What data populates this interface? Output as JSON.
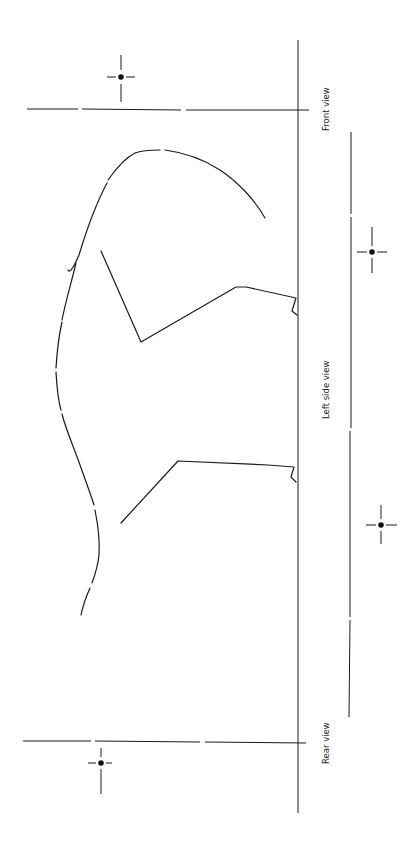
{
  "diagram": {
    "type": "orthographic-projection",
    "orientation": "rotated -90 degrees",
    "labels": {
      "front": "Front view",
      "side": "Left side view",
      "rear": "Rear view"
    },
    "colors": {
      "line": "#1a1a1a",
      "background": "#ffffff"
    },
    "elements": {
      "baselines": [
        {
          "name": "main-ground-line",
          "orientation": "vertical"
        },
        {
          "name": "secondary-reference-line",
          "orientation": "vertical"
        },
        {
          "name": "front-view-horizontal-line",
          "orientation": "horizontal"
        },
        {
          "name": "rear-view-horizontal-line",
          "orientation": "horizontal"
        }
      ],
      "crosshairs": [
        {
          "name": "front-view-center-mark"
        },
        {
          "name": "front-wheel-center-mark"
        },
        {
          "name": "rear-wheel-center-mark"
        },
        {
          "name": "rear-view-center-mark"
        }
      ],
      "profile_curves": [
        {
          "name": "roof-profile-curve"
        },
        {
          "name": "front-wheel-arch"
        },
        {
          "name": "rear-wheel-arch"
        }
      ]
    }
  }
}
